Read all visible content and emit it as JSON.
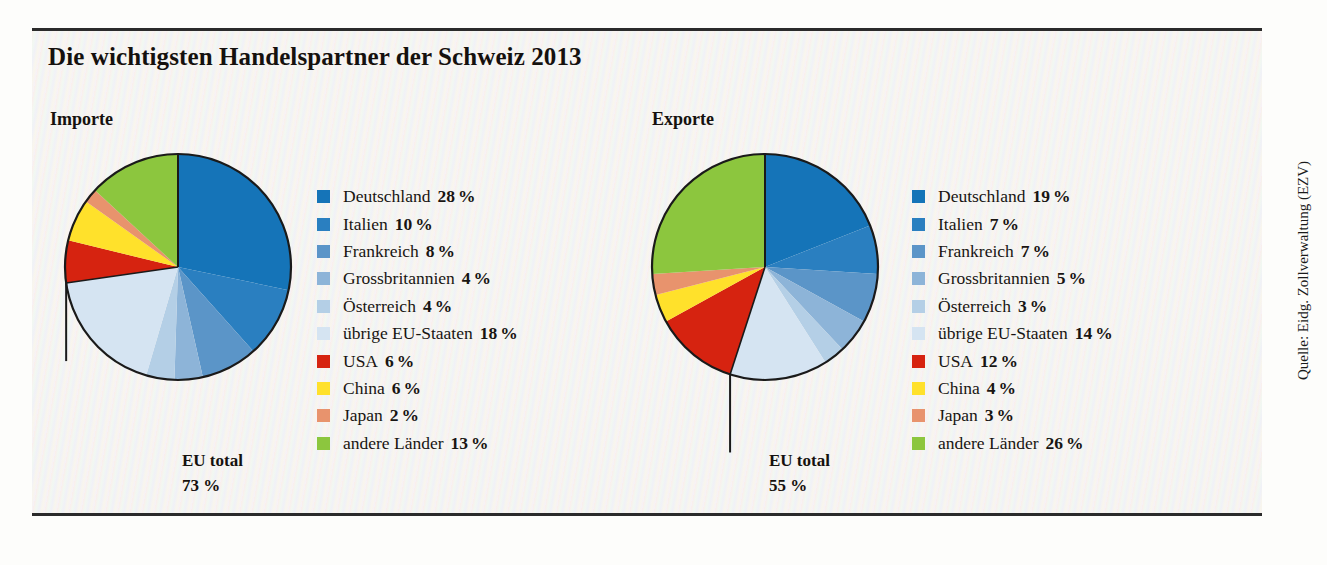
{
  "title": "Die wichtigsten Handelspartner der Schweiz 2013",
  "source": "Quelle: Eidg. Zollverwaltung (EZV)",
  "sections": {
    "imports": {
      "label": "Importe",
      "eu_total_label": "EU total",
      "eu_total_value": "73 %"
    },
    "exports": {
      "label": "Exporte",
      "eu_total_label": "EU total",
      "eu_total_value": "55 %"
    }
  },
  "colors": {
    "deutschland": "#1574b8",
    "italien": "#2a7fc0",
    "frankreich": "#5b95c8",
    "grossbritannien": "#8db4d8",
    "oesterreich": "#b4cfe6",
    "uebrige_eu": "#d5e4f2",
    "usa": "#d62310",
    "china": "#ffe12b",
    "japan": "#e8936d",
    "andere_laender": "#8cc63e",
    "outline": "#1a1a1a",
    "text": "#15110e",
    "panel_bg": "#f3f2ee"
  },
  "percent_symbol": "%",
  "chart_data": [
    {
      "type": "pie",
      "title": "Importe",
      "annotation": "EU total 73 %",
      "categories": [
        "Deutschland",
        "Italien",
        "Frankreich",
        "Grossbritannien",
        "Österreich",
        "übrige EU-Staaten",
        "USA",
        "China",
        "Japan",
        "andere Länder"
      ],
      "values": [
        28,
        10,
        8,
        4,
        4,
        18,
        6,
        6,
        2,
        13
      ],
      "unit": "%",
      "colors": [
        "#1574b8",
        "#2a7fc0",
        "#5b95c8",
        "#8db4d8",
        "#b4cfe6",
        "#d5e4f2",
        "#d62310",
        "#ffe12b",
        "#e8936d",
        "#8cc63e"
      ],
      "start_angle": 0,
      "direction": "clockwise",
      "legend_position": "right"
    },
    {
      "type": "pie",
      "title": "Exporte",
      "annotation": "EU total 55 %",
      "categories": [
        "Deutschland",
        "Italien",
        "Frankreich",
        "Grossbritannien",
        "Österreich",
        "übrige EU-Staaten",
        "USA",
        "China",
        "Japan",
        "andere Länder"
      ],
      "values": [
        19,
        7,
        7,
        5,
        3,
        14,
        12,
        4,
        3,
        26
      ],
      "unit": "%",
      "colors": [
        "#1574b8",
        "#2a7fc0",
        "#5b95c8",
        "#8db4d8",
        "#b4cfe6",
        "#d5e4f2",
        "#d62310",
        "#ffe12b",
        "#e8936d",
        "#8cc63e"
      ],
      "start_angle": 0,
      "direction": "clockwise",
      "legend_position": "right"
    }
  ],
  "legends": {
    "imports": [
      {
        "name": "Deutschland",
        "value": "28",
        "pct": "%",
        "color": "#1574b8"
      },
      {
        "name": "Italien",
        "value": "10",
        "pct": "%",
        "color": "#2a7fc0"
      },
      {
        "name": "Frankreich",
        "value": "8",
        "pct": "%",
        "color": "#5b95c8"
      },
      {
        "name": "Grossbritannien",
        "value": "4",
        "pct": "%",
        "color": "#8db4d8"
      },
      {
        "name": "Österreich",
        "value": "4",
        "pct": "%",
        "color": "#b4cfe6"
      },
      {
        "name": "übrige EU-Staaten",
        "value": "18",
        "pct": "%",
        "color": "#d5e4f2"
      },
      {
        "name": "USA",
        "value": "6",
        "pct": "%",
        "color": "#d62310"
      },
      {
        "name": "China",
        "value": "6",
        "pct": "%",
        "color": "#ffe12b"
      },
      {
        "name": "Japan",
        "value": "2",
        "pct": "%",
        "color": "#e8936d"
      },
      {
        "name": "andere Länder",
        "value": "13",
        "pct": "%",
        "color": "#8cc63e"
      }
    ],
    "exports": [
      {
        "name": "Deutschland",
        "value": "19",
        "pct": "%",
        "color": "#1574b8"
      },
      {
        "name": "Italien",
        "value": "7",
        "pct": "%",
        "color": "#2a7fc0"
      },
      {
        "name": "Frankreich",
        "value": "7",
        "pct": "%",
        "color": "#5b95c8"
      },
      {
        "name": "Grossbritannien",
        "value": "5",
        "pct": "%",
        "color": "#8db4d8"
      },
      {
        "name": "Österreich",
        "value": "3",
        "pct": "%",
        "color": "#b4cfe6"
      },
      {
        "name": "übrige EU-Staaten",
        "value": "14",
        "pct": "%",
        "color": "#d5e4f2"
      },
      {
        "name": "USA",
        "value": "12",
        "pct": "%",
        "color": "#d62310"
      },
      {
        "name": "China",
        "value": "4",
        "pct": "%",
        "color": "#ffe12b"
      },
      {
        "name": "Japan",
        "value": "3",
        "pct": "%",
        "color": "#e8936d"
      },
      {
        "name": "andere Länder",
        "value": "26",
        "pct": "%",
        "color": "#8cc63e"
      }
    ]
  }
}
